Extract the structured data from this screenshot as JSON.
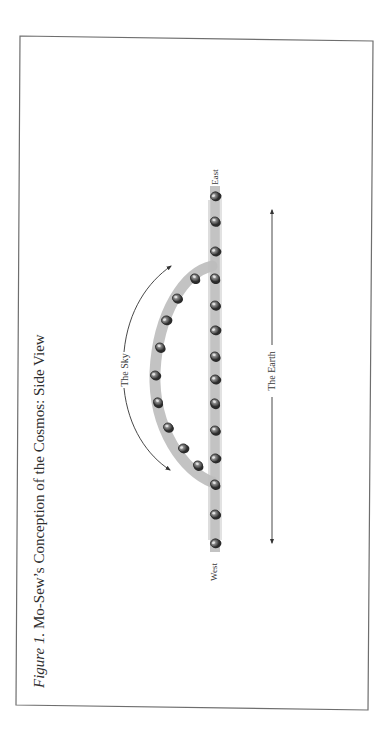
{
  "figure": {
    "caption_prefix": "Figure 1.",
    "caption_text": " Mo-Sew’s Conception of the Cosmos: Side View",
    "labels": {
      "sky": "The Sky",
      "earth": "The Earth",
      "east": "East",
      "west": "West"
    },
    "colors": {
      "frame": "#6e6e6e",
      "band": "#b8b8b8",
      "stone": "#4a4a4a",
      "stone_highlight": "#d6d6d6",
      "arrow": "#333333",
      "text": "#3a3a3a"
    },
    "earth_stones_y": [
      196,
      221,
      251,
      278,
      305,
      330,
      356,
      379,
      403,
      430,
      458,
      484,
      514,
      543
    ],
    "sky_stones": [
      {
        "x": 195,
        "y": 278
      },
      {
        "x": 177,
        "y": 298
      },
      {
        "x": 166,
        "y": 320
      },
      {
        "x": 160,
        "y": 347
      },
      {
        "x": 155,
        "y": 375
      },
      {
        "x": 158,
        "y": 402
      },
      {
        "x": 168,
        "y": 427
      },
      {
        "x": 183,
        "y": 448
      },
      {
        "x": 198,
        "y": 465
      }
    ]
  }
}
